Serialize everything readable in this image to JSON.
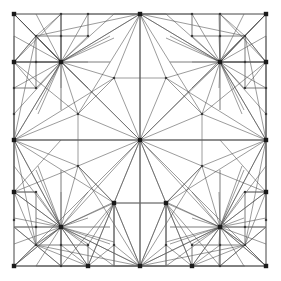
{
  "figure": {
    "kind": "mesh-diagram",
    "background_color": "#ffffff",
    "edge_color": "#4a4a4a",
    "frame_color": "#6e6e6e",
    "node_color": "#1a1a1a",
    "canvas": {
      "width": 281,
      "height": 281
    },
    "domain": {
      "x_min": 14,
      "y_min": 14,
      "x_max": 266,
      "y_max": 266
    }
  },
  "chart_data": {
    "type": "mesh",
    "xlabel": "",
    "ylabel": "",
    "xlim": [
      14,
      266
    ],
    "ylim": [
      14,
      266
    ],
    "grid": false,
    "legend": "none",
    "counts": {
      "major_nodes": 21,
      "minor_nodes": 40,
      "total_nodes": 61
    },
    "major_nodes": [
      {
        "id": "c",
        "x": 140,
        "y": 140,
        "label": "center-hub"
      },
      {
        "id": "h1",
        "x": 61,
        "y": 62,
        "label": "hub-top-left"
      },
      {
        "id": "h2",
        "x": 220,
        "y": 62,
        "label": "hub-top-right"
      },
      {
        "id": "h3",
        "x": 61,
        "y": 227,
        "label": "hub-bottom-left"
      },
      {
        "id": "h4",
        "x": 220,
        "y": 227,
        "label": "hub-bottom-right"
      },
      {
        "id": "e_t",
        "x": 140,
        "y": 14,
        "label": "edge-top-mid"
      },
      {
        "id": "e_b",
        "x": 140,
        "y": 266,
        "label": "edge-bottom-mid"
      },
      {
        "id": "e_l",
        "x": 14,
        "y": 140,
        "label": "edge-left-mid"
      },
      {
        "id": "e_r",
        "x": 266,
        "y": 140,
        "label": "edge-right-mid"
      },
      {
        "id": "k_tl",
        "x": 14,
        "y": 14,
        "label": "corner-top-left"
      },
      {
        "id": "k_tr",
        "x": 266,
        "y": 14,
        "label": "corner-top-right"
      },
      {
        "id": "k_bl",
        "x": 14,
        "y": 266,
        "label": "corner-bottom-left"
      },
      {
        "id": "k_br",
        "x": 266,
        "y": 266,
        "label": "corner-bottom-right"
      },
      {
        "id": "l2",
        "x": 14,
        "y": 192,
        "label": "left-node-lower"
      },
      {
        "id": "r2",
        "x": 266,
        "y": 192,
        "label": "right-node-lower"
      },
      {
        "id": "b1",
        "x": 88,
        "y": 266,
        "label": "bottom-node-left"
      },
      {
        "id": "b2",
        "x": 192,
        "y": 266,
        "label": "bottom-node-right"
      },
      {
        "id": "m1",
        "x": 114,
        "y": 203,
        "label": "mid-lower-left"
      },
      {
        "id": "m2",
        "x": 166,
        "y": 203,
        "label": "mid-lower-right"
      },
      {
        "id": "l1",
        "x": 14,
        "y": 62,
        "label": "left-node-upper"
      },
      {
        "id": "r1",
        "x": 266,
        "y": 62,
        "label": "right-node-upper"
      }
    ],
    "minor_nodes": [
      {
        "x": 88,
        "y": 14
      },
      {
        "x": 192,
        "y": 14
      },
      {
        "x": 61,
        "y": 14
      },
      {
        "x": 220,
        "y": 14
      },
      {
        "x": 14,
        "y": 88
      },
      {
        "x": 14,
        "y": 114
      },
      {
        "x": 266,
        "y": 88
      },
      {
        "x": 266,
        "y": 114
      },
      {
        "x": 14,
        "y": 220
      },
      {
        "x": 266,
        "y": 220
      },
      {
        "x": 61,
        "y": 266
      },
      {
        "x": 220,
        "y": 266
      },
      {
        "x": 114,
        "y": 78
      },
      {
        "x": 166,
        "y": 78
      },
      {
        "x": 78,
        "y": 114
      },
      {
        "x": 202,
        "y": 114
      },
      {
        "x": 78,
        "y": 166
      },
      {
        "x": 202,
        "y": 166
      },
      {
        "x": 36,
        "y": 36
      },
      {
        "x": 88,
        "y": 36
      },
      {
        "x": 245,
        "y": 36
      },
      {
        "x": 192,
        "y": 36
      },
      {
        "x": 36,
        "y": 88
      },
      {
        "x": 245,
        "y": 88
      },
      {
        "x": 36,
        "y": 192
      },
      {
        "x": 245,
        "y": 192
      },
      {
        "x": 36,
        "y": 245
      },
      {
        "x": 88,
        "y": 245
      },
      {
        "x": 192,
        "y": 245
      },
      {
        "x": 245,
        "y": 245
      },
      {
        "x": 36,
        "y": 62
      },
      {
        "x": 245,
        "y": 62
      },
      {
        "x": 36,
        "y": 227
      },
      {
        "x": 245,
        "y": 227
      },
      {
        "x": 61,
        "y": 36
      },
      {
        "x": 220,
        "y": 36
      },
      {
        "x": 61,
        "y": 245
      },
      {
        "x": 220,
        "y": 245
      },
      {
        "x": 114,
        "y": 245
      },
      {
        "x": 166,
        "y": 245
      }
    ],
    "edges_note": "Edges connect each hub radially to its surrounding ring nodes and corner nodes; structural frame lines run along x=14,61,88,140,192,220,266 and y=14,62,88,140,192,227,266."
  }
}
